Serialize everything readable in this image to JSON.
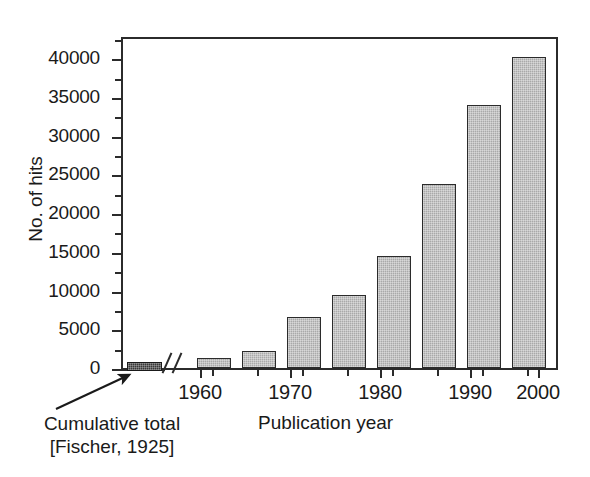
{
  "chart_data": {
    "type": "bar",
    "title": "",
    "xlabel": "Publication year",
    "ylabel": "No. of hits",
    "ylim": [
      0,
      43000
    ],
    "ytick_major": [
      0,
      5000,
      10000,
      15000,
      20000,
      25000,
      30000,
      35000,
      40000
    ],
    "ytick_labels": [
      "0",
      "5000",
      "10000",
      "15000",
      "20000",
      "25000",
      "30000",
      "35000",
      "40000"
    ],
    "ytick_minor": [
      2500,
      7500,
      12500,
      17500,
      22500,
      27500,
      32500,
      37500,
      42500
    ],
    "grid": false,
    "legend": false,
    "xtick_labels": [
      "1960",
      "1970",
      "1980",
      "1990",
      "2000"
    ],
    "xticks_x": [
      200,
      290,
      380,
      470,
      538
    ],
    "categories": [
      "1965",
      "1970",
      "1975",
      "1980",
      "1985",
      "1990",
      "1995",
      "2000"
    ],
    "values": [
      1300,
      2200,
      6600,
      9400,
      14500,
      23800,
      34000,
      40200
    ],
    "bars": [
      {
        "label": "1965",
        "value": 1300,
        "x": 195,
        "width": 34
      },
      {
        "label": "1970",
        "value": 2200,
        "x": 240,
        "width": 34
      },
      {
        "label": "1975",
        "value": 6600,
        "x": 285,
        "width": 34
      },
      {
        "label": "1980",
        "value": 9400,
        "x": 330,
        "width": 34
      },
      {
        "label": "1985",
        "value": 14500,
        "x": 375,
        "width": 34
      },
      {
        "label": "1990",
        "value": 23800,
        "x": 420,
        "width": 34
      },
      {
        "label": "1995",
        "value": 34000,
        "x": 465,
        "width": 34
      },
      {
        "label": "2000",
        "value": 40200,
        "x": 510,
        "width": 34
      }
    ],
    "extra_series": [
      {
        "name": "Cumulative total [Fischer, 1925]",
        "value": 1200,
        "style": "dark",
        "position": "left-of-axis-break"
      }
    ],
    "axis_break": {
      "axis": "x",
      "symbol": "//",
      "x": 168
    },
    "annotations": [
      {
        "text_line1": "Cumulative total",
        "text_line2": "[Fischer, 1925]",
        "arrow": true,
        "points_to": "cumulative-bar"
      }
    ],
    "colors": {
      "bar_fill": "#a9a9a9",
      "bar_edge": "#2b2b2b",
      "cumulative_fill": "#383838",
      "axis": "#2b2b2b",
      "background": "#ffffff"
    }
  },
  "axis": {
    "y_title": "No. of hits",
    "x_title": "Publication year"
  },
  "annotation": {
    "line1": "Cumulative total",
    "line2": "[Fischer, 1925]"
  }
}
